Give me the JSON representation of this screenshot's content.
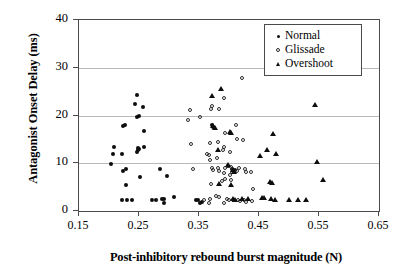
{
  "chart_data": {
    "type": "scatter",
    "title": "",
    "xlabel": "Post-inhibitory rebound burst magnitude (N)",
    "ylabel": "Antagonist Onset Delay (ms)",
    "xlim": [
      0.15,
      0.65
    ],
    "ylim": [
      0,
      40
    ],
    "xticks": [
      "0.15",
      "0.25",
      "0.35",
      "0.45",
      "0.55",
      "0.65"
    ],
    "xtick_values": [
      0.15,
      0.25,
      0.35,
      0.45,
      0.55,
      0.65
    ],
    "yticks": [
      "0",
      "10",
      "20",
      "30",
      "40"
    ],
    "ytick_values": [
      0,
      10,
      20,
      30,
      40
    ],
    "grid": "horizontal",
    "legend_position": "top-right",
    "series": [
      {
        "name": "Normal",
        "marker": "filled-circle",
        "color": "#0d0d0d",
        "points": [
          [
            0.203,
            9.9
          ],
          [
            0.206,
            11.9
          ],
          [
            0.209,
            13.4
          ],
          [
            0.222,
            12.0
          ],
          [
            0.223,
            17.8
          ],
          [
            0.226,
            18.0
          ],
          [
            0.224,
            8.4
          ],
          [
            0.228,
            8.8
          ],
          [
            0.229,
            5.5
          ],
          [
            0.222,
            2.4
          ],
          [
            0.23,
            2.4
          ],
          [
            0.239,
            2.4
          ],
          [
            0.243,
            22.5
          ],
          [
            0.246,
            24.3
          ],
          [
            0.247,
            19.6
          ],
          [
            0.25,
            19.8
          ],
          [
            0.248,
            13.2
          ],
          [
            0.249,
            12.7
          ],
          [
            0.247,
            12.3
          ],
          [
            0.25,
            13.0
          ],
          [
            0.252,
            7.2
          ],
          [
            0.256,
            21.7
          ],
          [
            0.258,
            16.8
          ],
          [
            0.259,
            13.5
          ],
          [
            0.272,
            2.2
          ],
          [
            0.278,
            2.3
          ],
          [
            0.285,
            8.7
          ],
          [
            0.288,
            2.6
          ],
          [
            0.291,
            2.5
          ],
          [
            0.292,
            1.6
          ],
          [
            0.296,
            7.4
          ],
          [
            0.308,
            2.9
          ],
          [
            0.345,
            2.4
          ],
          [
            0.349,
            2.3
          ],
          [
            0.352,
            1.6
          ],
          [
            0.355,
            1.9
          ],
          [
            0.372,
            18.0
          ],
          [
            0.374,
            17.6
          ],
          [
            0.399,
            9.5
          ],
          [
            0.405,
            8.7
          ],
          [
            0.408,
            8.3
          ],
          [
            0.41,
            8.6
          ]
        ]
      },
      {
        "name": "Glissade",
        "marker": "open-circle",
        "color": "#2b2b2b",
        "points": [
          [
            0.331,
            19.0
          ],
          [
            0.335,
            21.2
          ],
          [
            0.337,
            14.1
          ],
          [
            0.34,
            8.8
          ],
          [
            0.352,
            19.7
          ],
          [
            0.358,
            2.4
          ],
          [
            0.364,
            12.0
          ],
          [
            0.366,
            11.8
          ],
          [
            0.368,
            14.3
          ],
          [
            0.37,
            21.4
          ],
          [
            0.372,
            22.0
          ],
          [
            0.369,
            10.6
          ],
          [
            0.371,
            9.0
          ],
          [
            0.373,
            8.5
          ],
          [
            0.37,
            5.7
          ],
          [
            0.366,
            1.6
          ],
          [
            0.368,
            2.6
          ],
          [
            0.381,
            14.5
          ],
          [
            0.383,
            21.3
          ],
          [
            0.38,
            11.0
          ],
          [
            0.382,
            9.1
          ],
          [
            0.384,
            8.3
          ],
          [
            0.379,
            3.2
          ],
          [
            0.383,
            3.0
          ],
          [
            0.391,
            23.7
          ],
          [
            0.393,
            16.4
          ],
          [
            0.39,
            12.8
          ],
          [
            0.392,
            13.5
          ],
          [
            0.394,
            9.0
          ],
          [
            0.391,
            7.9
          ],
          [
            0.393,
            6.6
          ],
          [
            0.389,
            6.2
          ],
          [
            0.392,
            1.6
          ],
          [
            0.396,
            2.5
          ],
          [
            0.401,
            12.3
          ],
          [
            0.403,
            9.3
          ],
          [
            0.405,
            8.1
          ],
          [
            0.402,
            7.5
          ],
          [
            0.404,
            6.5
          ],
          [
            0.4,
            2.3
          ],
          [
            0.406,
            2.2
          ],
          [
            0.412,
            18.0
          ],
          [
            0.414,
            15.0
          ],
          [
            0.416,
            9.0
          ],
          [
            0.413,
            8.4
          ],
          [
            0.415,
            2.4
          ],
          [
            0.418,
            2.1
          ],
          [
            0.421,
            27.9
          ],
          [
            0.424,
            14.9
          ],
          [
            0.426,
            8.9
          ],
          [
            0.428,
            8.2
          ],
          [
            0.425,
            2.2
          ],
          [
            0.429,
            1.9
          ],
          [
            0.436,
            8.1
          ],
          [
            0.44,
            4.6
          ],
          [
            0.438,
            2.0
          ]
        ]
      },
      {
        "name": "Overshoot",
        "marker": "filled-triangle",
        "color": "#0d0d0d",
        "points": [
          [
            0.372,
            24.1
          ],
          [
            0.386,
            25.6
          ],
          [
            0.374,
            17.9
          ],
          [
            0.376,
            17.4
          ],
          [
            0.381,
            12.7
          ],
          [
            0.383,
            5.7
          ],
          [
            0.398,
            9.6
          ],
          [
            0.402,
            16.6
          ],
          [
            0.404,
            16.3
          ],
          [
            0.406,
            8.6
          ],
          [
            0.408,
            8.2
          ],
          [
            0.403,
            5.5
          ],
          [
            0.406,
            2.5
          ],
          [
            0.41,
            2.4
          ],
          [
            0.421,
            2.6
          ],
          [
            0.432,
            2.5
          ],
          [
            0.452,
            11.5
          ],
          [
            0.455,
            2.8
          ],
          [
            0.459,
            2.7
          ],
          [
            0.463,
            12.8
          ],
          [
            0.468,
            6.0
          ],
          [
            0.472,
            5.8
          ],
          [
            0.474,
            16.1
          ],
          [
            0.478,
            11.9
          ],
          [
            0.47,
            2.5
          ],
          [
            0.476,
            2.4
          ],
          [
            0.5,
            2.4
          ],
          [
            0.515,
            2.3
          ],
          [
            0.528,
            2.3
          ],
          [
            0.543,
            22.3
          ],
          [
            0.546,
            10.2
          ],
          [
            0.557,
            6.5
          ]
        ]
      }
    ]
  },
  "legend": {
    "items": [
      {
        "label": "Normal",
        "key": "filled-circle-icon"
      },
      {
        "label": "Glissade",
        "key": "open-circle-icon"
      },
      {
        "label": "Overshoot",
        "key": "filled-triangle-icon"
      }
    ]
  }
}
